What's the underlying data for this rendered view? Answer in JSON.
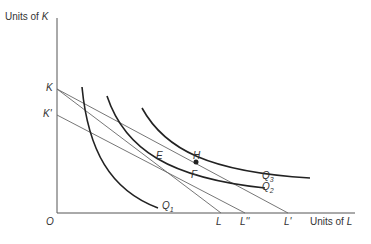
{
  "axes": {
    "y_label_prefix": "Units of ",
    "y_label_var": "K",
    "x_label_prefix": "Units of ",
    "x_label_var": "L",
    "origin": "O"
  },
  "intercepts": {
    "k": "K",
    "k_prime": "K'",
    "l": "L",
    "l_double_prime": "L''",
    "l_prime": "L'"
  },
  "isoquants": [
    {
      "name": "Q",
      "sub": "1"
    },
    {
      "name": "Q",
      "sub": "2"
    },
    {
      "name": "Q",
      "sub": "3"
    }
  ],
  "points": {
    "e": "E",
    "f": "F",
    "h": "H"
  },
  "colors": {
    "axis": "#555555",
    "curve": "#222222",
    "line": "#666666"
  }
}
